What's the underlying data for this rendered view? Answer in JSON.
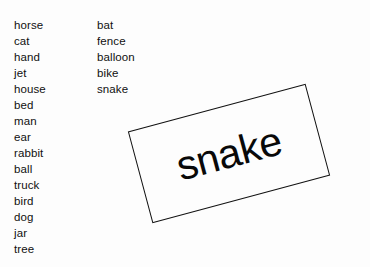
{
  "page": {
    "background_color": "#fdfdfd",
    "text_color": "#101010"
  },
  "word_lists": {
    "left_column": [
      "horse",
      "cat",
      "hand",
      "jet",
      "house",
      "bed",
      "man",
      "ear",
      "rabbit",
      "ball",
      "truck",
      "bird",
      "dog",
      "jar",
      "tree"
    ],
    "right_column": [
      "bat",
      "fence",
      "balloon",
      "bike",
      "snake"
    ]
  },
  "rotated_label": {
    "text": "snake",
    "rotation_degrees": -15,
    "border_color": "#111111",
    "fill_color": "#fdfdfd"
  }
}
